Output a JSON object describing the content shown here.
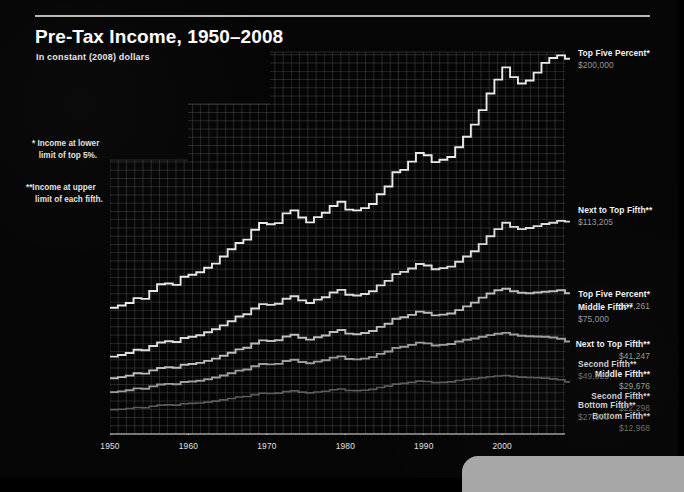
{
  "header": {
    "title": "Pre-Tax Income, 1950–2008",
    "subtitle": "In constant (2008) dollars"
  },
  "notes": {
    "note1": "* Income at lower\n   limit of top 5%.",
    "note2": "**Income at upper\n    limit of each fifth."
  },
  "colors": {
    "background": "#050505",
    "grid": "#6f6f6f",
    "axis": "#d8d8d8",
    "line_bright": "#e9e9e9",
    "line_mid": "#b4b4b4",
    "line_dim": "#8a8a8a",
    "line_faint": "#5e5e5e",
    "text": "#f2f2f2",
    "value_text": "#9a9a9a"
  },
  "left_labels": [
    {
      "name": "Top Five Percent*",
      "value": "$67,261",
      "top": 289
    },
    {
      "name": "Next to Top Fifth**",
      "value": "$41,247",
      "top": 339
    },
    {
      "name": "Middle Fifth**",
      "value": "$29,676",
      "top": 369
    },
    {
      "name": "Second Fifth**",
      "value": "$22,298",
      "top": 391
    },
    {
      "name": "Bottom Fifth**",
      "value": "$12,968",
      "top": 411
    }
  ],
  "right_labels": [
    {
      "name": "Top Five Percent*",
      "value": "$200,000",
      "top": 48
    },
    {
      "name": "Next to Top Fifth**",
      "value": "$113,205",
      "top": 205
    },
    {
      "name": "Middle Fifth**",
      "value": "$75,000",
      "top": 302
    },
    {
      "name": "Second Fifth**",
      "value": "$49,325",
      "top": 359
    },
    {
      "name": "Bottom Fifth**",
      "value": "$27,800",
      "top": 400
    }
  ],
  "chart_data": {
    "type": "line",
    "title": "Pre-Tax Income, 1950–2008",
    "subtitle": "In constant (2008) dollars",
    "xlabel": "",
    "ylabel": "",
    "grid": true,
    "legend": "endpoint-labels",
    "xlim": [
      1950,
      2008
    ],
    "ylim": [
      0,
      210000
    ],
    "xticks": [
      1950,
      1960,
      1970,
      1980,
      1990,
      2000
    ],
    "x": [
      1950,
      1951,
      1952,
      1953,
      1954,
      1955,
      1956,
      1957,
      1958,
      1959,
      1960,
      1961,
      1962,
      1963,
      1964,
      1965,
      1966,
      1967,
      1968,
      1969,
      1970,
      1971,
      1972,
      1973,
      1974,
      1975,
      1976,
      1977,
      1978,
      1979,
      1980,
      1981,
      1982,
      1983,
      1984,
      1985,
      1986,
      1987,
      1988,
      1989,
      1990,
      1991,
      1992,
      1993,
      1994,
      1995,
      1996,
      1997,
      1998,
      1999,
      2000,
      2001,
      2002,
      2003,
      2004,
      2005,
      2006,
      2007,
      2008
    ],
    "series": [
      {
        "name": "Top Five Percent*",
        "note": "Income at lower limit of top 5%.",
        "start_value": 67261,
        "end_value": 200000,
        "color": "#e9e9e9",
        "values": [
          67261,
          68500,
          69800,
          72400,
          72000,
          76200,
          79800,
          80200,
          79500,
          83800,
          84900,
          86200,
          88600,
          90800,
          94600,
          98500,
          101800,
          103600,
          108900,
          112500,
          111800,
          112400,
          117600,
          119200,
          115400,
          112800,
          115600,
          117900,
          121500,
          123800,
          119600,
          119200,
          120400,
          122600,
          127800,
          131900,
          139500,
          140800,
          145200,
          149800,
          148600,
          144900,
          146200,
          147600,
          152800,
          158400,
          164900,
          172600,
          181500,
          188900,
          195400,
          190200,
          186800,
          188400,
          192600,
          197800,
          200400,
          201800,
          200000
        ]
      },
      {
        "name": "Next to Top Fifth**",
        "note": "Income at upper limit of each fifth.",
        "start_value": 41247,
        "end_value": 113205,
        "color": "#dcdcdc",
        "values": [
          41247,
          42100,
          43200,
          44900,
          44600,
          46900,
          48800,
          49400,
          49000,
          51200,
          51800,
          52600,
          54200,
          55800,
          57900,
          60100,
          62600,
          63800,
          66900,
          69200,
          68800,
          69400,
          72100,
          73400,
          71200,
          69800,
          71600,
          72900,
          75400,
          76800,
          74200,
          73800,
          74600,
          76100,
          79200,
          81600,
          85200,
          86400,
          88200,
          90600,
          89800,
          87800,
          88400,
          89200,
          91800,
          94600,
          97400,
          101200,
          105400,
          109200,
          112600,
          110400,
          109200,
          109800,
          110800,
          111900,
          112600,
          113600,
          113205
        ]
      },
      {
        "name": "Middle Fifth**",
        "note": "Income at upper limit of each fifth.",
        "start_value": 29676,
        "end_value": 75000,
        "color": "#bdbdbd",
        "values": [
          29676,
          30300,
          31100,
          32400,
          32200,
          33900,
          35200,
          35600,
          35300,
          36900,
          37300,
          37900,
          39000,
          40200,
          41700,
          43300,
          45100,
          46000,
          48200,
          49900,
          49600,
          50000,
          52000,
          52900,
          51300,
          50300,
          51600,
          52500,
          54400,
          55400,
          53500,
          53200,
          53800,
          54900,
          57100,
          58800,
          61400,
          62200,
          63500,
          65200,
          64600,
          63200,
          63600,
          64200,
          66000,
          68000,
          70000,
          72700,
          74900,
          76600,
          77400,
          76100,
          75300,
          75000,
          75400,
          75800,
          76100,
          76600,
          75000
        ]
      },
      {
        "name": "Second Fifth**",
        "note": "Income at upper limit of each fifth.",
        "start_value": 22298,
        "end_value": 49325,
        "color": "#9d9d9d",
        "values": [
          22298,
          22700,
          23300,
          24300,
          24100,
          25400,
          26400,
          26700,
          26500,
          27700,
          28000,
          28400,
          29200,
          30100,
          31200,
          32400,
          33800,
          34400,
          36100,
          37300,
          37100,
          37400,
          38900,
          39600,
          38400,
          37700,
          38600,
          39300,
          40700,
          41400,
          40000,
          39800,
          40200,
          41000,
          42700,
          44000,
          45900,
          46500,
          47500,
          48700,
          48300,
          47200,
          47500,
          48000,
          49300,
          50200,
          50900,
          51800,
          52700,
          53400,
          53900,
          53000,
          52400,
          52100,
          52000,
          51800,
          51400,
          50800,
          49325
        ]
      },
      {
        "name": "Bottom Fifth**",
        "note": "Income at upper limit of each fifth.",
        "start_value": 12968,
        "end_value": 27800,
        "color": "#6a6a6a",
        "values": [
          12968,
          13200,
          13600,
          14100,
          14000,
          14800,
          15400,
          15500,
          15400,
          16100,
          16300,
          16500,
          17000,
          17500,
          18200,
          18900,
          19700,
          20000,
          21000,
          21700,
          21600,
          21800,
          22600,
          23000,
          22300,
          21900,
          22400,
          22800,
          23600,
          24000,
          23200,
          23100,
          23300,
          23800,
          24800,
          25500,
          26600,
          27000,
          27500,
          28200,
          28000,
          27400,
          27500,
          27800,
          28500,
          29100,
          29500,
          30000,
          30500,
          30900,
          31200,
          30700,
          30300,
          30100,
          30000,
          29800,
          29400,
          28900,
          27800
        ]
      }
    ]
  }
}
